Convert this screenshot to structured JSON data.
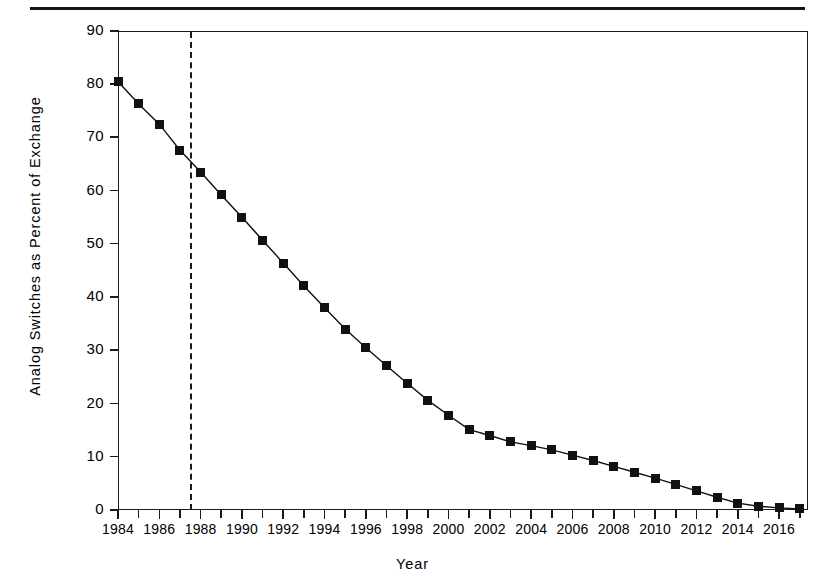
{
  "figure": {
    "background": "#ffffff",
    "ink_color": "#111111"
  },
  "axes": {
    "xlabel": "Year",
    "ylabel": "Analog Switches as Percent of Exchange",
    "y_ticks": [
      "0",
      "10",
      "20",
      "30",
      "40",
      "50",
      "60",
      "70",
      "80",
      "90"
    ],
    "x_ticks_labeled": [
      "1984",
      "1986",
      "1988",
      "1990",
      "1992",
      "1994",
      "1996",
      "1998",
      "2000",
      "2002",
      "2004",
      "2006",
      "2008",
      "2010",
      "2012",
      "2014",
      "2016"
    ]
  },
  "annotations": {
    "reference_line_year": "1987.5",
    "reference_line_style": "dashed"
  },
  "chart_data": {
    "type": "line",
    "title": "",
    "subtitle": "",
    "xlabel": "Year",
    "ylabel": "Analog Switches as Percent of Exchange",
    "xlim": [
      1984,
      2017.4
    ],
    "ylim": [
      0,
      90
    ],
    "y_tick_step": 10,
    "x_tick_step_major": 2,
    "x_tick_step_minor": 1,
    "grid": false,
    "legend": null,
    "marker": "filled-square",
    "line_color": "#111111",
    "x": [
      1984,
      1985,
      1986,
      1987,
      1988,
      1989,
      1990,
      1991,
      1992,
      1993,
      1994,
      1995,
      1996,
      1997,
      1998,
      1999,
      2000,
      2001,
      2002,
      2003,
      2004,
      2005,
      2006,
      2007,
      2008,
      2009,
      2010,
      2011,
      2012,
      2013,
      2014,
      2015,
      2016,
      2017
    ],
    "values": [
      80.5,
      76.3,
      72.5,
      67.6,
      63.5,
      59.2,
      55.0,
      50.7,
      46.4,
      42.1,
      38.0,
      34.0,
      30.5,
      27.1,
      23.8,
      20.6,
      17.8,
      15.1,
      14.0,
      12.8,
      12.1,
      11.3,
      10.3,
      9.3,
      8.2,
      7.1,
      6.0,
      4.8,
      3.6,
      2.4,
      1.3,
      0.7,
      0.4,
      0.2
    ],
    "annotations": [
      {
        "type": "vline",
        "x": 1987.5,
        "style": "dashed",
        "label": ""
      }
    ]
  }
}
